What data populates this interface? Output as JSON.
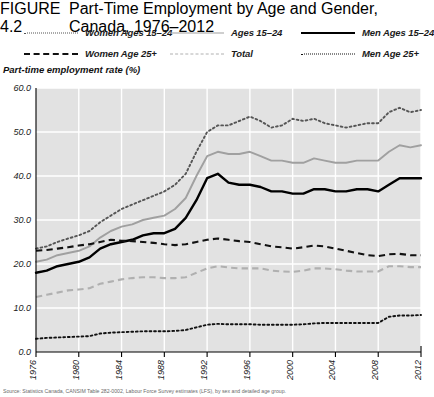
{
  "header": {
    "figure_number": "FIGURE 4.2",
    "title": "Part-Time Employment by Age and Gender, Canada, 1976–2012"
  },
  "legend": {
    "items": [
      {
        "label": "Women Ages 15–24",
        "style": "dotted",
        "color": "#555555",
        "column": 1,
        "row": 1
      },
      {
        "label": "Ages 15–24",
        "style": "solid",
        "color": "#a0a0a0",
        "column": 2,
        "row": 1
      },
      {
        "label": "Men Ages 15–24",
        "style": "solid",
        "color": "#000000",
        "column": 3,
        "row": 1
      },
      {
        "label": "Women Age 25+",
        "style": "dashed",
        "color": "#111111",
        "column": 1,
        "row": 2
      },
      {
        "label": "Total",
        "style": "dashed",
        "color": "#b0b0b0",
        "column": 2,
        "row": 2
      },
      {
        "label": "Men Age 25+",
        "style": "dotted",
        "color": "#111111",
        "column": 3,
        "row": 2
      }
    ]
  },
  "axis_title": "Part-time employment rate (%)",
  "footnote": "Source: Statistics Canada, CANSIM Table 282-0002, Labour Force Survey estimates (LFS), by sex and detailed age group.",
  "chart_data": {
    "type": "line",
    "title": "Part-Time Employment by Age and Gender, Canada, 1976–2012",
    "xlabel": "",
    "ylabel": "Part-time employment rate (%)",
    "xlim": [
      1976,
      2012
    ],
    "ylim": [
      0.0,
      60.0
    ],
    "yticks": [
      0.0,
      10.0,
      20.0,
      30.0,
      40.0,
      50.0,
      60.0
    ],
    "ytick_labels": [
      "0.0",
      "10.0",
      "20.0",
      "30.0",
      "40.0",
      "50.0",
      "60.0"
    ],
    "xticks": [
      1976,
      1980,
      1984,
      1988,
      1992,
      1996,
      2000,
      2004,
      2008,
      2012
    ],
    "xtick_labels": [
      "1976",
      "1980",
      "1984",
      "1988",
      "1992",
      "1996",
      "2000",
      "2004",
      "2008",
      "2012"
    ],
    "grid": true,
    "grid_color": "#ffffff",
    "plot_background": "#e2e2e2",
    "legend_position": "above-plot",
    "x": [
      1976,
      1977,
      1978,
      1979,
      1980,
      1981,
      1982,
      1983,
      1984,
      1985,
      1986,
      1987,
      1988,
      1989,
      1990,
      1991,
      1992,
      1993,
      1994,
      1995,
      1996,
      1997,
      1998,
      1999,
      2000,
      2001,
      2002,
      2003,
      2004,
      2005,
      2006,
      2007,
      2008,
      2009,
      2010,
      2011,
      2012
    ],
    "series": [
      {
        "name": "Women Ages 15–24",
        "style": "dotted",
        "color": "#555555",
        "values": [
          23.5,
          24.0,
          25.0,
          25.8,
          26.5,
          27.5,
          29.5,
          31.0,
          32.5,
          33.5,
          34.5,
          35.5,
          36.5,
          38.0,
          40.5,
          45.5,
          50.0,
          51.5,
          51.5,
          52.5,
          53.5,
          52.5,
          51.0,
          51.5,
          53.0,
          52.5,
          53.0,
          52.0,
          51.5,
          51.0,
          51.5,
          52.0,
          52.0,
          54.5,
          55.5,
          54.5,
          55.0
        ]
      },
      {
        "name": "Ages 15–24",
        "style": "solid",
        "color": "#a0a0a0",
        "values": [
          20.5,
          21.0,
          22.0,
          22.5,
          23.0,
          24.0,
          26.0,
          27.5,
          28.5,
          29.0,
          30.0,
          30.5,
          31.0,
          32.5,
          35.0,
          40.0,
          44.5,
          45.5,
          45.0,
          45.0,
          45.5,
          44.5,
          43.5,
          43.5,
          43.0,
          43.0,
          44.0,
          43.5,
          43.0,
          43.0,
          43.5,
          43.5,
          43.5,
          45.5,
          47.0,
          46.5,
          47.0
        ]
      },
      {
        "name": "Men Ages 15–24",
        "style": "solid",
        "color": "#000000",
        "values": [
          18.0,
          18.5,
          19.5,
          20.0,
          20.5,
          21.5,
          23.5,
          24.5,
          25.0,
          25.5,
          26.5,
          27.0,
          27.0,
          28.0,
          30.5,
          34.5,
          39.5,
          40.5,
          38.5,
          38.0,
          38.0,
          37.5,
          36.5,
          36.5,
          36.0,
          36.0,
          37.0,
          37.0,
          36.5,
          36.5,
          37.0,
          37.0,
          36.5,
          38.0,
          39.5,
          39.5,
          39.5
        ]
      },
      {
        "name": "Women Age 25+",
        "style": "dashed",
        "color": "#111111",
        "values": [
          23.0,
          23.2,
          23.5,
          23.8,
          24.2,
          24.5,
          25.0,
          25.5,
          25.3,
          25.2,
          25.0,
          24.8,
          24.5,
          24.3,
          24.5,
          25.0,
          25.5,
          25.8,
          25.5,
          25.2,
          25.0,
          24.5,
          24.0,
          23.8,
          23.5,
          23.8,
          24.2,
          24.0,
          23.5,
          23.0,
          22.5,
          22.0,
          21.8,
          22.2,
          22.3,
          22.0,
          22.0
        ]
      },
      {
        "name": "Total",
        "style": "dashed",
        "color": "#b0b0b0",
        "values": [
          12.5,
          13.0,
          13.5,
          14.0,
          14.2,
          14.5,
          15.5,
          16.0,
          16.5,
          16.8,
          17.0,
          17.0,
          16.8,
          16.8,
          17.0,
          18.0,
          19.0,
          19.5,
          19.2,
          19.0,
          19.0,
          19.0,
          18.5,
          18.3,
          18.2,
          18.5,
          19.0,
          19.0,
          18.8,
          18.5,
          18.3,
          18.3,
          18.3,
          19.5,
          19.5,
          19.3,
          19.3
        ]
      },
      {
        "name": "Men Age 25+",
        "style": "dotted",
        "color": "#111111",
        "values": [
          3.0,
          3.2,
          3.3,
          3.4,
          3.5,
          3.6,
          4.2,
          4.4,
          4.5,
          4.6,
          4.7,
          4.7,
          4.7,
          4.8,
          5.0,
          5.6,
          6.2,
          6.4,
          6.3,
          6.3,
          6.3,
          6.2,
          6.2,
          6.2,
          6.2,
          6.3,
          6.5,
          6.6,
          6.6,
          6.6,
          6.6,
          6.6,
          6.6,
          8.0,
          8.3,
          8.3,
          8.4
        ]
      }
    ]
  }
}
